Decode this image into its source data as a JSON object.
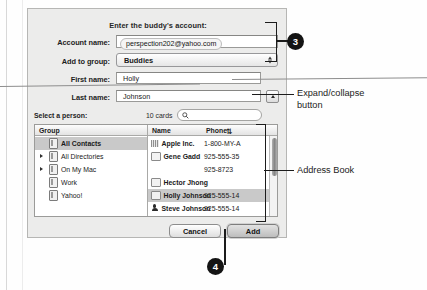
{
  "dialog": {
    "title": "Enter the buddy's account:",
    "fields": {
      "account_name_label": "Account name:",
      "account_name_value": "perspection202@yahoo.com",
      "add_to_group_label": "Add to group:",
      "add_to_group_value": "Buddies",
      "first_name_label": "First name:",
      "first_name_value": "Holly",
      "last_name_label": "Last name:",
      "last_name_value": "Johnson"
    },
    "picker": {
      "select_label": "Select a person:",
      "cards_count": "10 cards",
      "search_placeholder": "",
      "group_column_header": "Group",
      "name_column_header": "Name",
      "phone_column_header": "Phone",
      "groups": [
        {
          "label": "All Contacts",
          "expandable": false,
          "selected": true
        },
        {
          "label": "All Directories",
          "expandable": true,
          "selected": false
        },
        {
          "label": "On My Mac",
          "expandable": true,
          "selected": false
        },
        {
          "label": "Work",
          "expandable": false,
          "selected": false
        },
        {
          "label": "Yahoo!",
          "expandable": false,
          "selected": false
        }
      ],
      "people": [
        {
          "name": "Apple Inc.",
          "icon": "building-icon",
          "phone": "1-800-MY-A",
          "selected": false
        },
        {
          "name": "Gene Gadd",
          "icon": "card-icon",
          "phone": "925-555-35",
          "selected": false
        },
        {
          "name": "",
          "icon": "none",
          "phone": "925-8723",
          "selected": false
        },
        {
          "name": "Hector Jhong",
          "icon": "card-icon",
          "phone": "",
          "selected": false
        },
        {
          "name": "Holly Johnson",
          "icon": "card-icon",
          "phone": "925-555-14",
          "selected": true
        },
        {
          "name": "Steve Johnson",
          "icon": "person-icon",
          "phone": "925-555-14",
          "selected": false
        },
        {
          "name": "",
          "icon": "none",
          "phone": "925-555-14",
          "selected": false
        }
      ]
    },
    "buttons": {
      "cancel": "Cancel",
      "add": "Add"
    }
  },
  "annotations": {
    "callout_3": "3",
    "callout_4": "4",
    "expand_collapse": "Expand/collapse\nbutton",
    "address_book": "Address Book"
  }
}
